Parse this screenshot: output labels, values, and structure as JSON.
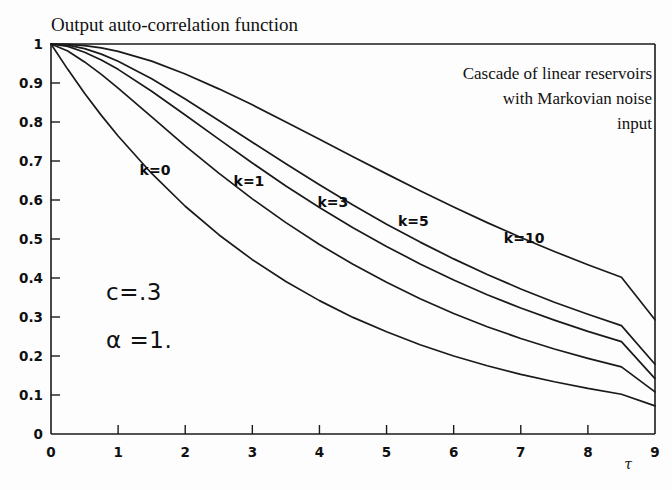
{
  "chart_data": {
    "type": "line",
    "title": "Output auto-correlation function",
    "xlabel": "τ",
    "ylabel": "",
    "xlim": [
      0,
      9
    ],
    "ylim": [
      0,
      1
    ],
    "grid": false,
    "legend_position": "inline-curve-labels",
    "x_ticks": [
      "0",
      "1",
      "2",
      "3",
      "4",
      "5",
      "6",
      "7",
      "8",
      "9"
    ],
    "y_ticks": [
      "0",
      "0.1",
      "0.2",
      "0.3",
      "0.4",
      "0.5",
      "0.6",
      "0.7",
      "0.8",
      "0.9",
      "1"
    ],
    "x": [
      0,
      0.25,
      0.5,
      0.75,
      1,
      1.5,
      2,
      2.5,
      3,
      3.5,
      4,
      4.5,
      5,
      5.5,
      6,
      6.5,
      7,
      7.5,
      8,
      8.5,
      9
    ],
    "series": [
      {
        "name": "k=0",
        "label": "k=0",
        "label_x": 1.55,
        "label_y": 0.665,
        "values": [
          1.0,
          0.935,
          0.874,
          0.817,
          0.764,
          0.668,
          0.584,
          0.511,
          0.447,
          0.391,
          0.342,
          0.299,
          0.262,
          0.229,
          0.2,
          0.175,
          0.153,
          0.134,
          0.117,
          0.102,
          0.072
        ]
      },
      {
        "name": "k=1",
        "label": "k=1",
        "label_x": 2.95,
        "label_y": 0.635,
        "values": [
          1.0,
          0.982,
          0.954,
          0.922,
          0.887,
          0.813,
          0.739,
          0.669,
          0.603,
          0.542,
          0.486,
          0.435,
          0.389,
          0.347,
          0.309,
          0.275,
          0.245,
          0.218,
          0.194,
          0.172,
          0.108
        ]
      },
      {
        "name": "k=3",
        "label": "k=3",
        "label_x": 4.2,
        "label_y": 0.582,
        "values": [
          1.0,
          0.994,
          0.979,
          0.959,
          0.935,
          0.879,
          0.818,
          0.756,
          0.695,
          0.636,
          0.581,
          0.529,
          0.481,
          0.436,
          0.395,
          0.357,
          0.323,
          0.292,
          0.263,
          0.237,
          0.142
        ]
      },
      {
        "name": "k=5",
        "label": "k=5",
        "label_x": 5.4,
        "label_y": 0.533,
        "values": [
          1.0,
          0.997,
          0.988,
          0.974,
          0.956,
          0.911,
          0.859,
          0.804,
          0.748,
          0.693,
          0.639,
          0.587,
          0.538,
          0.492,
          0.449,
          0.409,
          0.372,
          0.338,
          0.307,
          0.278,
          0.179
        ]
      },
      {
        "name": "k=10",
        "label": "k=10",
        "label_x": 7.05,
        "label_y": 0.49,
        "values": [
          1.0,
          0.999,
          0.996,
          0.99,
          0.981,
          0.956,
          0.923,
          0.885,
          0.844,
          0.8,
          0.756,
          0.711,
          0.667,
          0.624,
          0.582,
          0.542,
          0.504,
          0.468,
          0.434,
          0.402,
          0.293
        ]
      }
    ],
    "annotations": {
      "note_lines": [
        "Cascade of linear reservoirs",
        "with Markovian noise",
        "input"
      ],
      "parameters": [
        {
          "text": "c=.3"
        },
        {
          "text": "α =1."
        }
      ]
    }
  }
}
